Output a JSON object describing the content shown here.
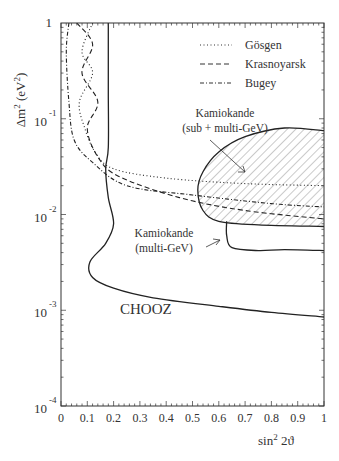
{
  "chart_data": {
    "type": "line",
    "title": "",
    "xlabel": "sin² 2θ",
    "ylabel": "Δm² (eV²)",
    "xlim": [
      0,
      1
    ],
    "ylim": [
      0.0001,
      1
    ],
    "yscale": "log",
    "x_ticks": [
      "0",
      "0.1",
      "0.2",
      "0.3",
      "0.4",
      "0.5",
      "0.6",
      "0.7",
      "0.8",
      "0.9",
      "1"
    ],
    "y_ticks": [
      {
        "base": "10",
        "exp": "-4",
        "value": 0.0001
      },
      {
        "base": "10",
        "exp": "-3",
        "value": 0.001
      },
      {
        "base": "10",
        "exp": "-2",
        "value": 0.01
      },
      {
        "base": "10",
        "exp": "-1",
        "value": 0.1
      },
      {
        "base": "1",
        "exp": "",
        "value": 1
      }
    ],
    "legend": {
      "position": "upper right",
      "entries": [
        {
          "label": "Gösgen",
          "style": "dotted"
        },
        {
          "label": "Krasnoyarsk",
          "style": "dashed"
        },
        {
          "label": "Bugey",
          "style": "dash-dot"
        }
      ]
    },
    "annotations": [
      {
        "text_lines": [
          "Kamiokande",
          "(sub + multi-GeV)"
        ],
        "arrow_to": [
          0.68,
          0.035
        ]
      },
      {
        "text_lines": [
          "Kamiokande",
          "(multi-GeV)"
        ],
        "arrow_to": [
          0.62,
          0.0065
        ]
      },
      {
        "text": "CHOOZ"
      }
    ],
    "series": [
      {
        "name": "CHOOZ",
        "style": "solid",
        "points": [
          [
            0.18,
            1
          ],
          [
            0.18,
            0.2
          ],
          [
            0.18,
            0.05
          ],
          [
            0.17,
            0.03
          ],
          [
            0.18,
            0.015
          ],
          [
            0.2,
            0.008
          ],
          [
            0.17,
            0.005
          ],
          [
            0.11,
            0.0032
          ],
          [
            0.12,
            0.0022
          ],
          [
            0.2,
            0.0017
          ],
          [
            0.35,
            0.00135
          ],
          [
            0.6,
            0.0011
          ],
          [
            0.8,
            0.00095
          ],
          [
            1.0,
            0.00085
          ]
        ]
      },
      {
        "name": "Gösgen",
        "style": "dotted",
        "points": [
          [
            0.12,
            1
          ],
          [
            0.08,
            0.5
          ],
          [
            0.12,
            0.3
          ],
          [
            0.07,
            0.15
          ],
          [
            0.09,
            0.08
          ],
          [
            0.13,
            0.045
          ],
          [
            0.2,
            0.03
          ],
          [
            0.4,
            0.024
          ],
          [
            0.7,
            0.021
          ],
          [
            1.0,
            0.02
          ]
        ]
      },
      {
        "name": "Krasnoyarsk",
        "style": "dashed",
        "points": [
          [
            0.06,
            1
          ],
          [
            0.12,
            0.6
          ],
          [
            0.08,
            0.3
          ],
          [
            0.14,
            0.15
          ],
          [
            0.1,
            0.08
          ],
          [
            0.14,
            0.04
          ],
          [
            0.22,
            0.025
          ],
          [
            0.45,
            0.015
          ],
          [
            0.7,
            0.011
          ],
          [
            1.0,
            0.009
          ]
        ]
      },
      {
        "name": "Bugey",
        "style": "dash-dot",
        "points": [
          [
            0.03,
            1
          ],
          [
            0.02,
            0.5
          ],
          [
            0.03,
            0.15
          ],
          [
            0.05,
            0.06
          ],
          [
            0.12,
            0.035
          ],
          [
            0.25,
            0.02
          ],
          [
            0.5,
            0.016
          ],
          [
            0.8,
            0.013
          ],
          [
            1.0,
            0.012
          ]
        ]
      },
      {
        "name": "Kamiokande (sub + multi-GeV)",
        "style": "solid-hatched",
        "points": [
          [
            1.0,
            0.075
          ],
          [
            0.85,
            0.08
          ],
          [
            0.7,
            0.065
          ],
          [
            0.6,
            0.045
          ],
          [
            0.54,
            0.028
          ],
          [
            0.52,
            0.018
          ],
          [
            0.54,
            0.011
          ],
          [
            0.6,
            0.0085
          ],
          [
            0.75,
            0.0078
          ],
          [
            1.0,
            0.0075
          ]
        ]
      },
      {
        "name": "Kamiokande (multi-GeV)",
        "style": "solid",
        "points": [
          [
            0.63,
            0.0085
          ],
          [
            0.63,
            0.006
          ],
          [
            0.65,
            0.0045
          ],
          [
            0.75,
            0.0042
          ],
          [
            0.85,
            0.0043
          ],
          [
            1.0,
            0.0042
          ]
        ]
      }
    ]
  },
  "legend": {
    "items": [
      "Gösgen",
      "Krasnoyarsk",
      "Bugey"
    ]
  },
  "labels": {
    "y_axis": "Δm",
    "y_axis_sup": "2",
    "y_axis_unit": "(eV",
    "y_axis_unit_sup": "2",
    "y_axis_close": ")",
    "x_axis_main": "sin",
    "x_axis_sup": "2",
    "x_axis_tail": " 2ϑ",
    "kam_sub_1": "Kamiokande",
    "kam_sub_2": "(sub + multi-GeV)",
    "kam_multi_1": "Kamiokande",
    "kam_multi_2": "(multi-GeV)",
    "chooz": "CHOOZ"
  }
}
